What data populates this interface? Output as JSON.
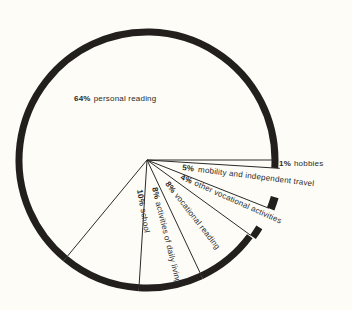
{
  "chart_data": {
    "type": "pie",
    "title": "",
    "start_angle_deg": 0,
    "direction": "clockwise",
    "slices": [
      {
        "label": "hobbies",
        "value": 1,
        "pct_text": "1%"
      },
      {
        "label": "mobility and independent travel",
        "value": 5,
        "pct_text": "5%"
      },
      {
        "label": "other vocational activities",
        "value": 4,
        "pct_text": "4%"
      },
      {
        "label": "vocational reading",
        "value": 8,
        "pct_text": "8%"
      },
      {
        "label": "activities of daily living",
        "value": 8,
        "pct_text": "8%"
      },
      {
        "label": "school",
        "value": 10,
        "pct_text": "10%"
      },
      {
        "label": "personal reading",
        "value": 64,
        "pct_text": "64%"
      }
    ],
    "legend": "none (labels placed on slices)",
    "grid": false
  },
  "style": {
    "background": "#fdfcf6",
    "ring_color": "#231f1d",
    "line_color": "#2a2a2a"
  }
}
